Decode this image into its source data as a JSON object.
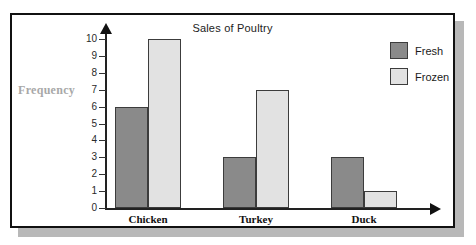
{
  "chart_data": {
    "type": "bar",
    "title": "Sales of Poultry",
    "xlabel": "",
    "ylabel": "Frequency",
    "categories": [
      "Chicken",
      "Turkey",
      "Duck"
    ],
    "series": [
      {
        "name": "Fresh",
        "color": "#8a8a8a",
        "values": [
          6,
          3,
          3
        ]
      },
      {
        "name": "Frozen",
        "color": "#e2e2e2",
        "values": [
          10,
          7,
          1
        ]
      }
    ],
    "ylim": [
      0,
      10
    ],
    "ytick_labels": [
      "10",
      "9",
      "8",
      "7",
      "6",
      "5",
      "4",
      "3",
      "2",
      "1",
      "0"
    ],
    "ytick_values": [
      10,
      9,
      8,
      7,
      6,
      5,
      4,
      3,
      2,
      1,
      0
    ],
    "grid": false,
    "legend_position": "top-right",
    "axis_arrows": true
  },
  "legend": {
    "entries": [
      {
        "label": "Fresh"
      },
      {
        "label": "Frozen"
      }
    ]
  },
  "icons": {
    "y_axis_arrow": "arrow-up-icon",
    "x_axis_arrow": "arrow-right-icon"
  }
}
